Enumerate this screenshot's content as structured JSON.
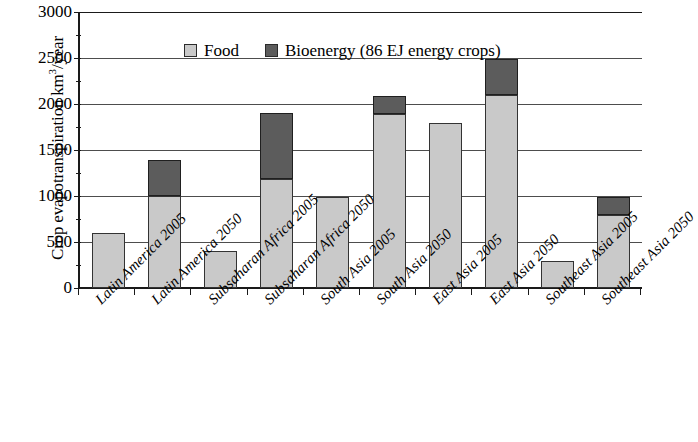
{
  "chart_data": {
    "type": "bar",
    "title": "",
    "subtitle": "",
    "stacked": true,
    "xlabel": "",
    "ylabel": "Crop evapotranspiration km3/year",
    "ylabel_parts": {
      "pre": "Crop evapotranspiration km",
      "sup": "3",
      "post": "/year"
    },
    "ylim": [
      0,
      3000
    ],
    "ytick_values": [
      0,
      500,
      1000,
      1500,
      2000,
      2500,
      3000
    ],
    "ytick_labels": [
      "0",
      "500",
      "1000",
      "1500",
      "2000",
      "2500",
      "3000"
    ],
    "yminor_values": [
      250,
      750,
      1250,
      1750,
      2250,
      2750
    ],
    "grid": true,
    "grid_axis": "y",
    "legend_position": "top-left-inside",
    "categories": [
      "Latin America 2005",
      "Latin America 2050",
      "Subsaharan Africa 2005",
      "Subsaharan Africa 2050",
      "South Asia 2005",
      "South Asia 2050",
      "East Asia 2005",
      "East Asia 2050",
      "Southeast Asia 2005",
      "Southeast Asia 2050"
    ],
    "series": [
      {
        "name": "Food",
        "color": "#c9c9c9",
        "values": [
          600,
          1000,
          400,
          1180,
          990,
          1890,
          1790,
          2100,
          290,
          790
        ]
      },
      {
        "name": "Bioenergy (86 EJ energy crops)",
        "color": "#5c5c5c",
        "values": [
          0,
          390,
          0,
          720,
          0,
          200,
          0,
          390,
          0,
          200
        ]
      }
    ],
    "totals": [
      600,
      1390,
      400,
      1900,
      990,
      2090,
      1790,
      2490,
      290,
      990
    ]
  },
  "legend": {
    "entries": [
      {
        "label": "Food",
        "color": "#c9c9c9"
      },
      {
        "label": "Bioenergy (86 EJ energy crops)",
        "color": "#5c5c5c"
      }
    ]
  },
  "colors": {
    "food": "#c9c9c9",
    "bioenergy": "#5c5c5c",
    "axis": "#1a1a1a",
    "gridline": "#4d4d4d",
    "background": "#ffffff"
  }
}
